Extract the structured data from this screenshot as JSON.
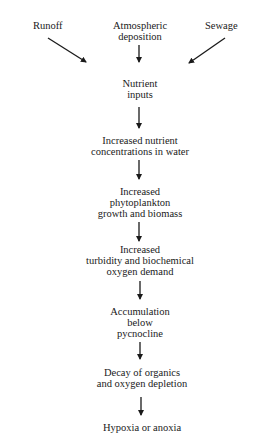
{
  "diagram": {
    "title": "",
    "sources": [
      {
        "id": "runoff",
        "label": "Runoff"
      },
      {
        "id": "atmospheric",
        "lines": [
          "Atmospheric",
          "deposition"
        ]
      },
      {
        "id": "sewage",
        "label": "Sewage"
      }
    ],
    "nodes": [
      {
        "id": "nutrient-inputs",
        "lines": [
          "Nutrient",
          "inputs"
        ]
      },
      {
        "id": "nutrient-concentrations",
        "lines": [
          "Increased nutrient",
          "concentrations in water"
        ]
      },
      {
        "id": "phytoplankton",
        "lines": [
          "Increased",
          "phytoplankton",
          "growth and biomass"
        ]
      },
      {
        "id": "turbidity",
        "lines": [
          "Increased",
          "turbidity and biochemical",
          "oxygen demand"
        ]
      },
      {
        "id": "accumulation",
        "lines": [
          "Accumulation",
          "below",
          "pycnocline"
        ]
      },
      {
        "id": "decay",
        "lines": [
          "Decay of organics",
          "and oxygen depletion"
        ]
      },
      {
        "id": "hypoxia",
        "lines": [
          "Hypoxia or anoxia"
        ]
      }
    ],
    "edges": [
      [
        "runoff",
        "nutrient-inputs"
      ],
      [
        "atmospheric",
        "nutrient-inputs"
      ],
      [
        "sewage",
        "nutrient-inputs"
      ],
      [
        "nutrient-inputs",
        "nutrient-concentrations"
      ],
      [
        "nutrient-concentrations",
        "phytoplankton"
      ],
      [
        "phytoplankton",
        "turbidity"
      ],
      [
        "turbidity",
        "accumulation"
      ],
      [
        "accumulation",
        "decay"
      ],
      [
        "decay",
        "hypoxia"
      ]
    ],
    "colors": {
      "text": "#1a1a1a",
      "arrow": "#1a1a1a",
      "background": "#ffffff"
    }
  }
}
